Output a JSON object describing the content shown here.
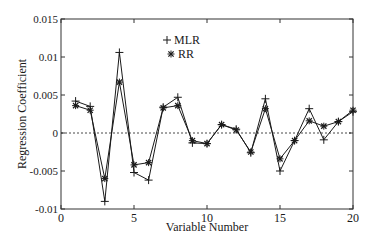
{
  "chart_data": {
    "type": "line",
    "title": "",
    "xlabel": "Variable Number",
    "ylabel": "Regression Coefficient",
    "xlim": [
      0,
      20
    ],
    "ylim": [
      -0.01,
      0.015
    ],
    "x_ticks": [
      0,
      5,
      10,
      15,
      20
    ],
    "x_tick_labels": [
      "0",
      "5",
      "10",
      "15",
      "20"
    ],
    "y_ticks": [
      -0.01,
      -0.005,
      0,
      0.005,
      0.01,
      0.015
    ],
    "y_tick_labels": [
      "-0.01",
      "-0.005",
      "0",
      "0.005",
      "0.01",
      "0.015"
    ],
    "grid": false,
    "reference_line": {
      "y": 0,
      "style": "dashed"
    },
    "legend": {
      "position": "upper-center-left",
      "entries": [
        {
          "label": "MLR",
          "marker": "+"
        },
        {
          "label": "RR",
          "marker": "*"
        }
      ]
    },
    "x": [
      1,
      2,
      3,
      4,
      5,
      6,
      7,
      8,
      9,
      10,
      11,
      12,
      13,
      14,
      15,
      16,
      17,
      18,
      19,
      20
    ],
    "series": [
      {
        "name": "MLR",
        "marker": "+",
        "values": [
          0.0042,
          0.0035,
          -0.009,
          0.0106,
          -0.0052,
          -0.0062,
          0.0034,
          0.0047,
          -0.0013,
          -0.0014,
          0.0011,
          0.0005,
          -0.0026,
          0.0045,
          -0.005,
          -0.001,
          0.0032,
          -0.0009,
          0.0015,
          0.0028
        ]
      },
      {
        "name": "RR",
        "marker": "*",
        "values": [
          0.0036,
          0.003,
          -0.006,
          0.0067,
          -0.0042,
          -0.0039,
          0.0033,
          0.0036,
          -0.001,
          -0.0014,
          0.0011,
          0.0004,
          -0.0025,
          0.0032,
          -0.0034,
          -0.001,
          0.0016,
          0.0009,
          0.0015,
          0.003
        ]
      }
    ]
  },
  "colors": {
    "line": "#1a1a1a",
    "axis": "#333333",
    "background": "#ffffff"
  }
}
